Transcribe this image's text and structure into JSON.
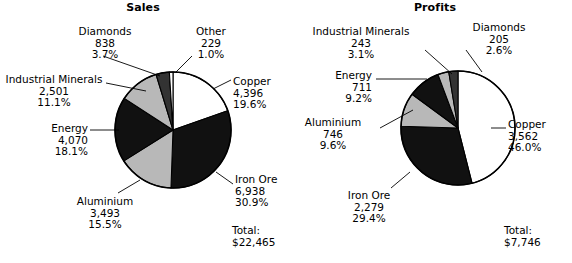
{
  "chart_data": [
    {
      "type": "pie",
      "title": "Sales",
      "total_label": "Total:",
      "total_value": "$22,465",
      "total_numeric": 22465,
      "start_angle": 0,
      "direction": "clockwise",
      "legend": "none",
      "slices": [
        {
          "name": "Copper",
          "value": "4,396",
          "numeric": 4396,
          "percent": "19.6%",
          "pct": 19.6,
          "color": "#ffffff"
        },
        {
          "name": "Iron Ore",
          "value": "6,938",
          "numeric": 6938,
          "percent": "30.9%",
          "pct": 30.9,
          "color": "#111111"
        },
        {
          "name": "Aluminium",
          "value": "3,493",
          "numeric": 3493,
          "percent": "15.5%",
          "pct": 15.5,
          "color": "#b8b8b8"
        },
        {
          "name": "Energy",
          "value": "4,070",
          "numeric": 4070,
          "percent": "18.1%",
          "pct": 18.1,
          "color": "#111111"
        },
        {
          "name": "Industrial Minerals",
          "value": "2,501",
          "numeric": 2501,
          "percent": "11.1%",
          "pct": 11.1,
          "color": "#b8b8b8"
        },
        {
          "name": "Diamonds",
          "value": "838",
          "numeric": 838,
          "percent": "3.7%",
          "pct": 3.7,
          "color": "#333333"
        },
        {
          "name": "Other",
          "value": "229",
          "numeric": 229,
          "percent": "1.0%",
          "pct": 1.0,
          "color": "#ffffff"
        }
      ]
    },
    {
      "type": "pie",
      "title": "Profits",
      "total_label": "Total:",
      "total_value": "$7,746",
      "total_numeric": 7746,
      "start_angle": 0,
      "direction": "clockwise",
      "legend": "none",
      "slices": [
        {
          "name": "Copper",
          "value": "3,562",
          "numeric": 3562,
          "percent": "46.0%",
          "pct": 46.0,
          "color": "#ffffff"
        },
        {
          "name": "Iron Ore",
          "value": "2,279",
          "numeric": 2279,
          "percent": "29.4%",
          "pct": 29.4,
          "color": "#111111"
        },
        {
          "name": "Aluminium",
          "value": "746",
          "numeric": 746,
          "percent": "9.6%",
          "pct": 9.6,
          "color": "#b8b8b8"
        },
        {
          "name": "Energy",
          "value": "711",
          "numeric": 711,
          "percent": "9.2%",
          "pct": 9.2,
          "color": "#111111"
        },
        {
          "name": "Industrial Minerals",
          "value": "243",
          "numeric": 243,
          "percent": "3.1%",
          "pct": 3.1,
          "color": "#b8b8b8"
        },
        {
          "name": "Diamonds",
          "value": "205",
          "numeric": 205,
          "percent": "2.6%",
          "pct": 2.6,
          "color": "#333333"
        }
      ]
    }
  ],
  "sales": {
    "title": "Sales",
    "total_label": "Total:",
    "total_value": "$22,465",
    "labels": {
      "diamonds": {
        "name": "Diamonds",
        "value": "838",
        "percent": "3.7%"
      },
      "other": {
        "name": "Other",
        "value": "229",
        "percent": "1.0%"
      },
      "industrial": {
        "name": "Industrial Minerals",
        "value": "2,501",
        "percent": "11.1%"
      },
      "copper": {
        "name": "Copper",
        "value": "4,396",
        "percent": "19.6%"
      },
      "energy": {
        "name": "Energy",
        "value": "4,070",
        "percent": "18.1%"
      },
      "ironore": {
        "name": "Iron Ore",
        "value": "6,938",
        "percent": "30.9%"
      },
      "aluminium": {
        "name": "Aluminium",
        "value": "3,493",
        "percent": "15.5%"
      }
    }
  },
  "profits": {
    "title": "Profits",
    "total_label": "Total:",
    "total_value": "$7,746",
    "labels": {
      "industrial": {
        "name": "Industrial Minerals",
        "value": "243",
        "percent": "3.1%"
      },
      "diamonds": {
        "name": "Diamonds",
        "value": "205",
        "percent": "2.6%"
      },
      "energy": {
        "name": "Energy",
        "value": "711",
        "percent": "9.2%"
      },
      "aluminium": {
        "name": "Aluminium",
        "value": "746",
        "percent": "9.6%"
      },
      "copper": {
        "name": "Copper",
        "value": "3,562",
        "percent": "46.0%"
      },
      "ironore": {
        "name": "Iron Ore",
        "value": "2,279",
        "percent": "29.4%"
      }
    }
  }
}
